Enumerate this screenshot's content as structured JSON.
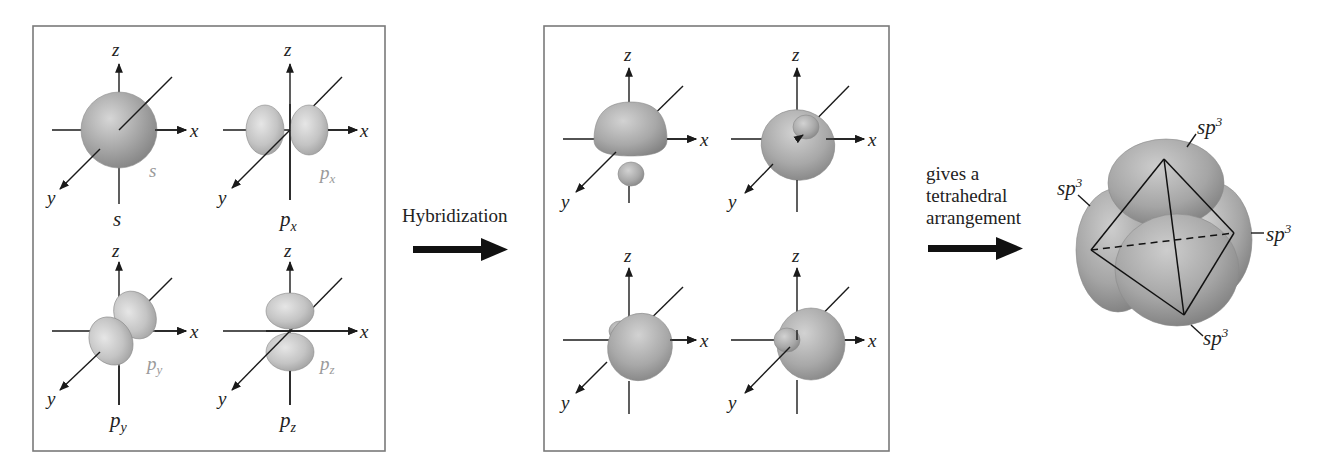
{
  "figure": {
    "atomic_orbitals_panel": {
      "orbitals": [
        {
          "name": "s",
          "caption": "s",
          "inner_label": "s",
          "inner_sub": ""
        },
        {
          "name": "px",
          "caption": "p",
          "caption_sub": "x",
          "inner_label": "p",
          "inner_sub": "x"
        },
        {
          "name": "py",
          "caption": "p",
          "caption_sub": "y",
          "inner_label": "p",
          "inner_sub": "y"
        },
        {
          "name": "pz",
          "caption": "p",
          "caption_sub": "z",
          "inner_label": "p",
          "inner_sub": "z"
        }
      ],
      "axis_labels": {
        "x": "x",
        "y": "y",
        "z": "z"
      }
    },
    "hybridization_arrow": {
      "label": "Hybridization"
    },
    "hybrid_orbitals_panel": {
      "count": 4,
      "axis_labels": {
        "x": "x",
        "y": "y",
        "z": "z"
      }
    },
    "tetrahedral_arrow": {
      "lines": [
        "gives a",
        "tetrahedral",
        "arrangement"
      ]
    },
    "tetrahedral_result": {
      "lobe_labels": [
        {
          "base": "sp",
          "sup": "3",
          "position": "top"
        },
        {
          "base": "sp",
          "sup": "3",
          "position": "left"
        },
        {
          "base": "sp",
          "sup": "3",
          "position": "right"
        },
        {
          "base": "sp",
          "sup": "3",
          "position": "bottom"
        }
      ]
    },
    "colors": {
      "orbital_light": "#d8d8d8",
      "orbital_mid": "#a8a8a8",
      "orbital_dark": "#7c7c7c",
      "box_border": "#7a7a7a",
      "grey_label": "#9a9a9a",
      "ink": "#1a1a1a"
    }
  }
}
